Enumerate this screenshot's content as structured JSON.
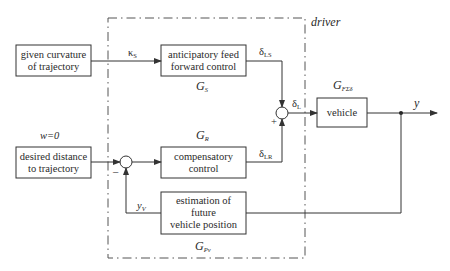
{
  "diagram": {
    "type": "block-diagram",
    "container": {
      "label": "driver"
    },
    "blocks": [
      {
        "id": "given-curvature",
        "lines": [
          "given curvature",
          "of trajectory"
        ]
      },
      {
        "id": "anticipatory",
        "lines": [
          "anticipatory feed",
          "forward control"
        ],
        "tf": "G",
        "tf_sub": "S"
      },
      {
        "id": "desired-distance",
        "lines": [
          "desired distance",
          "to trajectory"
        ]
      },
      {
        "id": "compensatory",
        "lines": [
          "compensatory",
          "control"
        ],
        "tf": "G",
        "tf_sub": "R"
      },
      {
        "id": "estimation",
        "lines": [
          "estimation of",
          "future",
          "vehicle position"
        ],
        "tf": "G",
        "tf_sub": "Pv"
      },
      {
        "id": "vehicle",
        "lines": [
          "vehicle"
        ],
        "tf": "G",
        "tf_sub": "FΣδ"
      }
    ],
    "signals": {
      "kappa": {
        "sym": "κ",
        "sub": "S"
      },
      "delta_ls": {
        "sym": "δ",
        "sub": "LS"
      },
      "delta_lr": {
        "sym": "δ",
        "sub": "LR"
      },
      "delta_l": {
        "sym": "δ",
        "sub": "L"
      },
      "y": {
        "sym": "y"
      },
      "yv": {
        "sym": "y",
        "sub": "V"
      },
      "w": "w=0"
    },
    "summers": {
      "s1": {
        "minus": "–"
      },
      "s2": {
        "plus": "+"
      }
    }
  }
}
